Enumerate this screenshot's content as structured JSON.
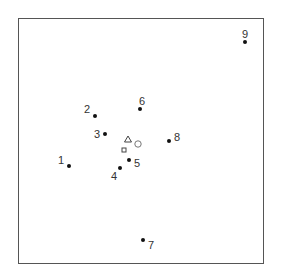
{
  "diagram": {
    "type": "scatter-configuration",
    "frame": {
      "left": 18,
      "top": 18,
      "size": 246
    },
    "points": [
      {
        "id": "1",
        "x": 69,
        "y": 166,
        "lx": 61,
        "ly": 160
      },
      {
        "id": "2",
        "x": 95,
        "y": 116,
        "lx": 87,
        "ly": 109
      },
      {
        "id": "3",
        "x": 105,
        "y": 134,
        "lx": 97,
        "ly": 134
      },
      {
        "id": "4",
        "x": 120,
        "y": 168,
        "lx": 114,
        "ly": 176
      },
      {
        "id": "5",
        "x": 129,
        "y": 160,
        "lx": 137,
        "ly": 163
      },
      {
        "id": "6",
        "x": 140,
        "y": 109,
        "lx": 142,
        "ly": 101
      },
      {
        "id": "7",
        "x": 143,
        "y": 240,
        "lx": 151,
        "ly": 245
      },
      {
        "id": "8",
        "x": 169,
        "y": 141,
        "lx": 177,
        "ly": 137
      },
      {
        "id": "9",
        "x": 245,
        "y": 42,
        "lx": 245,
        "ly": 34
      }
    ],
    "markers": [
      {
        "shape": "triangle",
        "x": 128,
        "y": 140
      },
      {
        "shape": "circle",
        "x": 138,
        "y": 144
      },
      {
        "shape": "square",
        "x": 124,
        "y": 150
      }
    ]
  }
}
